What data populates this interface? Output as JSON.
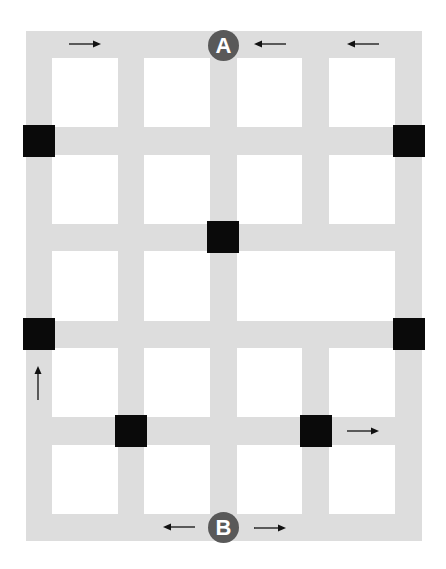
{
  "diagram": {
    "type": "street-grid-map",
    "colors": {
      "road": "#dddddd",
      "block": "#ffffff",
      "intersection_node": "#0a0a0a",
      "marker": "#595959",
      "marker_text": "#ffffff",
      "arrow": "#111111"
    },
    "markers": [
      {
        "id": "A",
        "label": "A",
        "position": "top-center"
      },
      {
        "id": "B",
        "label": "B",
        "position": "bottom-center"
      }
    ],
    "blocks": [
      {
        "row": 1,
        "cols": [
          1
        ]
      },
      {
        "row": 1,
        "cols": [
          2
        ]
      },
      {
        "row": 1,
        "cols": [
          3
        ]
      },
      {
        "row": 1,
        "cols": [
          4
        ]
      },
      {
        "row": 2,
        "cols": [
          1
        ]
      },
      {
        "row": 2,
        "cols": [
          2
        ]
      },
      {
        "row": 2,
        "cols": [
          3
        ]
      },
      {
        "row": 2,
        "cols": [
          4
        ]
      },
      {
        "row": 3,
        "cols": [
          1
        ]
      },
      {
        "row": 3,
        "cols": [
          2
        ]
      },
      {
        "row": 3,
        "cols": [
          3,
          4
        ]
      },
      {
        "row": 4,
        "cols": [
          1
        ]
      },
      {
        "row": 4,
        "cols": [
          2
        ]
      },
      {
        "row": 4,
        "cols": [
          3
        ]
      },
      {
        "row": 4,
        "cols": [
          4
        ]
      },
      {
        "row": 5,
        "cols": [
          1
        ]
      },
      {
        "row": 5,
        "cols": [
          2
        ]
      },
      {
        "row": 5,
        "cols": [
          3
        ]
      },
      {
        "row": 5,
        "cols": [
          4
        ]
      }
    ],
    "black_squares": [
      {
        "street_row": 1,
        "street_col": 0
      },
      {
        "street_row": 1,
        "street_col": 4
      },
      {
        "street_row": 2,
        "street_col": 2
      },
      {
        "street_row": 3,
        "street_col": 0
      },
      {
        "street_row": 3,
        "street_col": 4
      },
      {
        "street_row": 4,
        "street_col": 1
      },
      {
        "street_row": 4,
        "street_col": 3
      }
    ],
    "arrows": [
      {
        "location": "top street, left of A",
        "direction": "right"
      },
      {
        "location": "top street, right of A",
        "direction": "left"
      },
      {
        "location": "top street, far right",
        "direction": "left"
      },
      {
        "location": "left street, lower",
        "direction": "up"
      },
      {
        "location": "fourth horizontal street, right",
        "direction": "right"
      },
      {
        "location": "bottom street, left of B",
        "direction": "left"
      },
      {
        "location": "bottom street, right of B",
        "direction": "right"
      }
    ]
  }
}
